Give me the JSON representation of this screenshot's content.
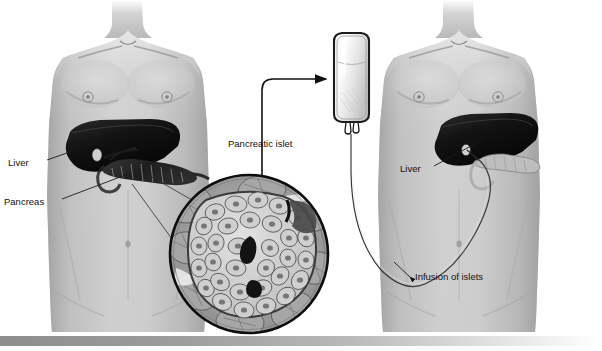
{
  "figure": {
    "width": 602,
    "height": 351,
    "background_color": "#ffffff"
  },
  "labels": {
    "liver_left": "Liver",
    "pancreas_left": "Pancreas",
    "pancreatic_islet": "Pancreatic islet",
    "liver_right": "Liver",
    "infusion_of_islets": "Infusion of islets"
  },
  "panels": {
    "donor": {
      "name": "donor-torso",
      "organs": [
        "liver",
        "pancreas"
      ]
    },
    "recipient": {
      "name": "recipient-torso",
      "organs": [
        "liver",
        "pancreas"
      ]
    },
    "magnifier": {
      "name": "islet-cross-section",
      "depicts": "pancreatic islet of Langerhans surrounded by acinar tissue"
    },
    "infusion_bag": {
      "name": "iv-bag",
      "depicts": "bag of isolated islets for infusion"
    }
  },
  "colors": {
    "skin_light": "#d8d8d8",
    "skin_mid": "#b4b4b4",
    "skin_shadow": "#8f8f8f",
    "organ_liver": "#161616",
    "organ_pancreas": "#2a2a2a",
    "line": "#111111",
    "text": "#111111",
    "footer_bar": "#9a9a9a"
  },
  "footer": {
    "bar_label": "gradient-divider-bar"
  }
}
